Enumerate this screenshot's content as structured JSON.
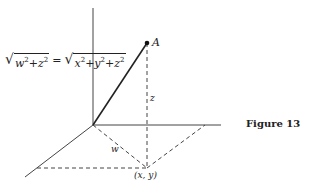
{
  "figure": {
    "caption": "Figure 13",
    "equation": {
      "lhs_terms": [
        "w",
        "+",
        "z"
      ],
      "rhs_terms": [
        "x",
        "+",
        "y",
        "+",
        "z"
      ],
      "exponent": "2",
      "equals": "="
    },
    "labels": {
      "point_a": "A",
      "z": "z",
      "w": "w",
      "xy": "(x, y)"
    },
    "colors": {
      "ink": "#222222",
      "background": "#ffffff"
    }
  }
}
